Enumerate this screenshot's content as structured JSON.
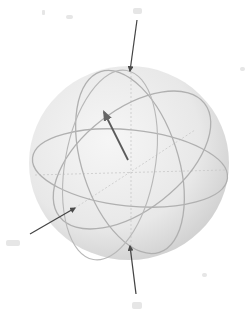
{
  "diagram": {
    "type": "bloch-sphere",
    "colors": {
      "sphere_fill": "#ececec",
      "sphere_shade": "#d6d6d6",
      "great_circle": "#b4b4b4",
      "dashed_axis": "#c4c4c4",
      "arrow": "#4a4a4a",
      "state_vector": "#555555",
      "label": "#d8d8d8"
    },
    "arrows": [
      {
        "name": "top-pointer",
        "direction": "down"
      },
      {
        "name": "left-pointer",
        "direction": "up-right"
      },
      {
        "name": "bottom-pointer",
        "direction": "up"
      }
    ],
    "state_vector": {
      "name": "state-vector",
      "direction": "up-left"
    },
    "labels": [
      {
        "name": "label-top",
        "text": ""
      },
      {
        "name": "label-top-left",
        "text": ""
      },
      {
        "name": "label-left",
        "text": ""
      },
      {
        "name": "label-bottom",
        "text": ""
      }
    ]
  }
}
